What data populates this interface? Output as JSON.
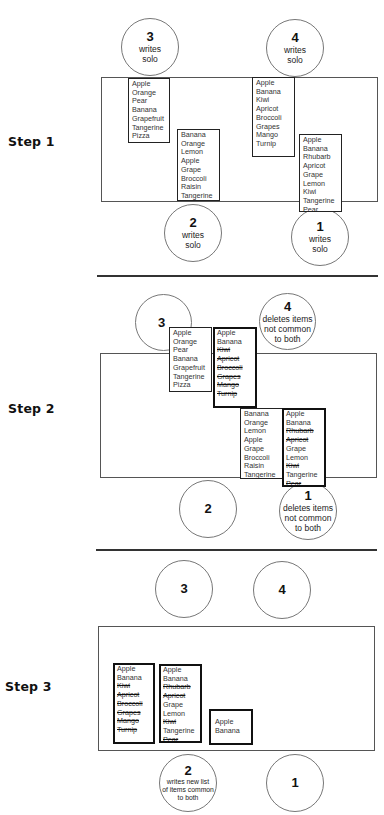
{
  "steps": [
    {
      "label": "Step 1",
      "circles": {
        "s3": {
          "number": "3",
          "desc": [
            "writes",
            "solo"
          ]
        },
        "s4": {
          "number": "4",
          "desc": [
            "writes",
            "solo"
          ]
        },
        "s2": {
          "number": "2",
          "desc": [
            "writes",
            "solo"
          ]
        },
        "s1": {
          "number": "1",
          "desc": [
            "writes",
            "solo"
          ]
        }
      },
      "lists": {
        "s3": {
          "items": [
            "Apple",
            "Orange",
            "Pear",
            "Banana",
            "Grapefruit",
            "Tangerine",
            "Pizza"
          ]
        },
        "s2": {
          "items": [
            "Banana",
            "Orange",
            "Lemon",
            "Apple",
            "Grape",
            "Broccoli",
            "Raisin",
            "Tangerine"
          ]
        },
        "s4": {
          "items": [
            "Apple",
            "Banana",
            "Kiwi",
            "Apricot",
            "Broccoli",
            "Grapes",
            "Mango",
            "Turnip"
          ]
        },
        "s1": {
          "items": [
            "Apple",
            "Banana",
            "Rhubarb",
            "Apricot",
            "Grape",
            "Lemon",
            "Kiwi",
            "Tangerine",
            "Pear"
          ]
        }
      }
    },
    {
      "label": "Step 2",
      "circles": {
        "s3": {
          "number": "3"
        },
        "s4": {
          "number": "4",
          "desc": [
            "deletes items",
            "not common",
            "to both"
          ]
        },
        "s2": {
          "number": "2"
        },
        "s1": {
          "number": "1",
          "desc": [
            "deletes  items",
            "not common",
            "to both"
          ]
        }
      },
      "lists": {
        "s3": {
          "items": [
            "Apple",
            "Orange",
            "Pear",
            "Banana",
            "Grapefruit",
            "Tangerine",
            "Pizza"
          ]
        },
        "s4": {
          "items": [
            "Apple",
            "Banana",
            "Kiwi",
            "Apricot",
            "Broccoli",
            "Grapes",
            "Mango",
            "Turnip"
          ],
          "struck": [
            "Kiwi",
            "Apricot",
            "Broccoli",
            "Grapes",
            "Mango",
            "Turnip"
          ]
        },
        "s2": {
          "items": [
            "Banana",
            "Orange",
            "Lemon",
            "Apple",
            "Grape",
            "Broccoli",
            "Raisin",
            "Tangerine"
          ]
        },
        "s1": {
          "items": [
            "Apple",
            "Banana",
            "Rhubarb",
            "Apricot",
            "Grape",
            "Lemon",
            "Kiwi",
            "Tangerine",
            "Pear"
          ],
          "struck": [
            "Rhubarb",
            "Apricot",
            "Kiwi",
            "Pear"
          ]
        }
      }
    },
    {
      "label": "Step 3",
      "circles": {
        "s3": {
          "number": "3"
        },
        "s4": {
          "number": "4"
        },
        "s2": {
          "number": "2",
          "desc": [
            "writes new list",
            "of items common",
            "to both"
          ]
        },
        "s1": {
          "number": "1"
        }
      },
      "lists": {
        "s4": {
          "items": [
            "Apple",
            "Banana",
            "Kiwi",
            "Apricot",
            "Broccoli",
            "Grapes",
            "Mango",
            "Turnip"
          ],
          "struck": [
            "Kiwi",
            "Apricot",
            "Broccoli",
            "Grapes",
            "Mango",
            "Turnip"
          ]
        },
        "s1": {
          "items": [
            "Apple",
            "Banana",
            "Rhubarb",
            "Apricot",
            "Grape",
            "Lemon",
            "Kiwi",
            "Tangerine",
            "Pear"
          ],
          "struck": [
            "Rhubarb",
            "Apricot",
            "Kiwi",
            "Pear"
          ]
        },
        "common": {
          "items": [
            "Apple",
            "Banana"
          ]
        }
      }
    }
  ]
}
